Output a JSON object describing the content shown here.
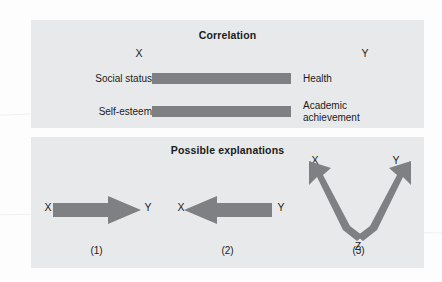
{
  "figure": {
    "panels": [
      {
        "id": "correlation",
        "title": "Correlation",
        "axis_labels": {
          "x": "X",
          "y": "Y"
        },
        "rows": [
          {
            "left": "Social status",
            "right": "Health"
          },
          {
            "left": "Self-esteem",
            "right_line1": "Academic",
            "right_line2": "achievement"
          }
        ]
      },
      {
        "id": "explanations",
        "title": "Possible explanations",
        "cells": [
          {
            "caption": "(1)",
            "left_node": "X",
            "right_node": "Y",
            "arrow_direction": "right",
            "meaning": "X causes Y"
          },
          {
            "caption": "(2)",
            "left_node": "X",
            "right_node": "Y",
            "arrow_direction": "left",
            "meaning": "Y causes X"
          },
          {
            "caption": "(3)",
            "top_left_node": "X",
            "top_right_node": "Y",
            "bottom_node": "Z",
            "arrow_direction": "fork-up",
            "meaning": "Z causes both X and Y"
          }
        ]
      }
    ],
    "colors": {
      "panel_background": "#e8e9ea",
      "bar_gray": "#7f8083",
      "arrow_gray": "#7f8083",
      "text": "#1b1b1b",
      "page_background": "#fdfdfd"
    }
  }
}
